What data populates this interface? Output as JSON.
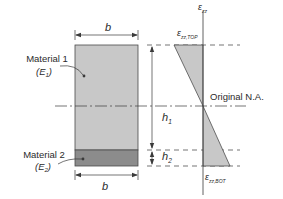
{
  "figure": {
    "type": "composite-beam-cross-section-and-strain-diagram",
    "colors": {
      "material1_fill": "#c8c8c8",
      "material2_fill": "#8c8c8c",
      "strain_fill": "#c8c8c8",
      "line": "#3a3a3a",
      "background": "#ffffff"
    },
    "cross_section": {
      "width_label_top": "b",
      "width_label_bottom": "b",
      "material1": {
        "label": "Material 1",
        "modulus": "(E",
        "modulus_sub": "1",
        "modulus_close": ")"
      },
      "material2": {
        "label": "Material 2",
        "modulus": "(E",
        "modulus_sub": "2",
        "modulus_close": ")"
      }
    },
    "dimensions": {
      "h1": {
        "main": "h",
        "sub": "1"
      },
      "h2": {
        "main": "h",
        "sub": "2"
      }
    },
    "neutral_axis": {
      "label": "Original N.A."
    },
    "strain_diagram": {
      "axis_label": {
        "main": "ε",
        "sub": "zz"
      },
      "top_label": {
        "main": "ε",
        "sub": "zz,TOP"
      },
      "bottom_label": {
        "main": "ε",
        "sub": "zz,BOT"
      }
    }
  }
}
